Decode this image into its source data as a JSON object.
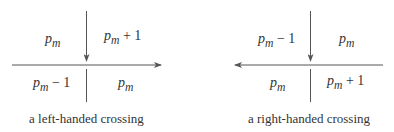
{
  "diagrams": [
    {
      "caption": "a left-handed crossing",
      "horizontal_arrow_direction": "right",
      "vertical_arrow_direction": "down",
      "regions": {
        "top_left": {
          "var": "p",
          "sub": "m",
          "suffix": ""
        },
        "top_right": {
          "var": "p",
          "sub": "m",
          "suffix": " + 1"
        },
        "bottom_left": {
          "var": "p",
          "sub": "m",
          "suffix": " − 1"
        },
        "bottom_right": {
          "var": "p",
          "sub": "m",
          "suffix": ""
        }
      }
    },
    {
      "caption": "a right-handed crossing",
      "horizontal_arrow_direction": "left",
      "vertical_arrow_direction": "down",
      "regions": {
        "top_left": {
          "var": "p",
          "sub": "m",
          "suffix": " − 1"
        },
        "top_right": {
          "var": "p",
          "sub": "m",
          "suffix": ""
        },
        "bottom_left": {
          "var": "p",
          "sub": "m",
          "suffix": ""
        },
        "bottom_right": {
          "var": "p",
          "sub": "m",
          "suffix": " + 1"
        }
      }
    }
  ],
  "colors": {
    "line": "#555555",
    "text": "#333333"
  }
}
